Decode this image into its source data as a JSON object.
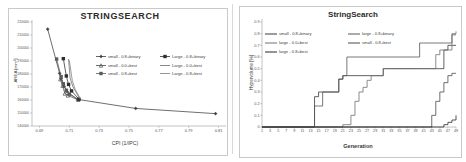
{
  "figure": {
    "background": "#ffffff",
    "panel_count": 2
  },
  "left_panel": {
    "title": "STRINGSEARCH",
    "frame_color": "#c9c9c9"
  },
  "right_panel": {
    "title": "StringSearch",
    "frame_color": "#c9c9c9"
  },
  "chart_data": [
    {
      "id": "left",
      "type": "scatter",
      "title": "STRINGSEARCH",
      "xlabel": "CPI (1/IPC)",
      "ylabel": "AREA [mm²]",
      "xlim": [
        0.685,
        0.815
      ],
      "ylim": [
        140000,
        220000
      ],
      "xticks": [
        0.69,
        0.71,
        0.73,
        0.75,
        0.77,
        0.79,
        0.81
      ],
      "xticklabels": [
        "0.69",
        "0.71",
        "0.73",
        "0.75",
        "0.77",
        "0.79",
        "0.81"
      ],
      "yticks": [
        140000,
        150000,
        160000,
        170000,
        180000,
        190000,
        200000,
        210000,
        220000
      ],
      "yticklabels": [
        "140000",
        "150000",
        "160000",
        "170000",
        "180000",
        "190000",
        "200000",
        "210000",
        "220000"
      ],
      "grid": false,
      "legend_position": "center-right",
      "line_color": "#3f3f3f",
      "series": [
        {
          "name": "small - 0.8+binary",
          "marker": "plus",
          "color": "#3f3f3f",
          "points": [
            {
              "x": 0.6955,
              "y": 214500
            },
            {
              "x": 0.7035,
              "y": 180500
            },
            {
              "x": 0.7045,
              "y": 176500
            },
            {
              "x": 0.7065,
              "y": 170500
            },
            {
              "x": 0.7085,
              "y": 166500
            },
            {
              "x": 0.7155,
              "y": 160500
            },
            {
              "x": 0.7545,
              "y": 153500
            },
            {
              "x": 0.808,
              "y": 149500
            }
          ]
        },
        {
          "name": "small - 0.0+best",
          "marker": "triangle",
          "color": "#4a4a4a",
          "points": [
            {
              "x": 0.704,
              "y": 176000
            },
            {
              "x": 0.7055,
              "y": 171000
            },
            {
              "x": 0.707,
              "y": 165000
            },
            {
              "x": 0.709,
              "y": 163500
            },
            {
              "x": 0.716,
              "y": 160200
            }
          ]
        },
        {
          "name": "small - 0.8+best",
          "marker": "square",
          "color": "#5a5a5a",
          "points": [
            {
              "x": 0.7015,
              "y": 191500
            },
            {
              "x": 0.7045,
              "y": 178000
            },
            {
              "x": 0.706,
              "y": 172500
            },
            {
              "x": 0.708,
              "y": 167500
            },
            {
              "x": 0.71,
              "y": 164500
            },
            {
              "x": 0.716,
              "y": 160400
            }
          ]
        },
        {
          "name": "Large - 0.8+binary",
          "marker": "square",
          "color": "#2f2f2f",
          "points": [
            {
              "x": 0.706,
              "y": 191800
            },
            {
              "x": 0.708,
              "y": 178500
            },
            {
              "x": 0.7095,
              "y": 172000
            },
            {
              "x": 0.7115,
              "y": 167000
            },
            {
              "x": 0.7165,
              "y": 160600
            }
          ]
        },
        {
          "name": "Large - 0.0+best",
          "marker": "none",
          "color": "#6a6a6a",
          "points": [
            {
              "x": 0.7095,
              "y": 191600
            },
            {
              "x": 0.7105,
              "y": 177000
            },
            {
              "x": 0.7125,
              "y": 170000
            },
            {
              "x": 0.717,
              "y": 161000
            }
          ]
        },
        {
          "name": "Large - 0.8+best",
          "marker": "none",
          "color": "#7a7a7a",
          "points": [
            {
              "x": 0.71,
              "y": 190500
            },
            {
              "x": 0.712,
              "y": 175000
            },
            {
              "x": 0.714,
              "y": 168000
            },
            {
              "x": 0.7175,
              "y": 160800
            }
          ]
        }
      ],
      "legend": [
        {
          "label": "small - 0.8+binary",
          "marker": "plus",
          "color": "#3f3f3f"
        },
        {
          "label": "Large - 0.8+binary",
          "marker": "square",
          "color": "#2f2f2f"
        },
        {
          "label": "small - 0.0+best",
          "marker": "triangle",
          "color": "#4a4a4a"
        },
        {
          "label": "Large - 0.0+best",
          "marker": "none",
          "color": "#6a6a6a"
        },
        {
          "label": "small - 0.8+best",
          "marker": "square",
          "color": "#5a5a5a"
        },
        {
          "label": "Large - 0.8+best",
          "marker": "none",
          "color": "#7a7a7a"
        }
      ]
    },
    {
      "id": "right",
      "type": "line",
      "title": "StringSearch",
      "xlabel": "Generation",
      "ylabel": "Hypervolume [%]",
      "xlim": [
        1,
        49
      ],
      "ylim": [
        0,
        0.9
      ],
      "xticks": [
        1,
        3,
        5,
        7,
        9,
        11,
        13,
        15,
        17,
        19,
        21,
        23,
        25,
        27,
        29,
        31,
        33,
        35,
        37,
        39,
        41,
        43,
        45,
        47,
        49
      ],
      "xticklabels": [
        "1",
        "3",
        "5",
        "7",
        "9",
        "11",
        "13",
        "15",
        "17",
        "19",
        "21",
        "23",
        "25",
        "27",
        "29",
        "31",
        "33",
        "35",
        "37",
        "39",
        "41",
        "43",
        "45",
        "47",
        "49"
      ],
      "yticks": [
        0,
        0.1,
        0.2,
        0.3,
        0.4,
        0.5,
        0.6,
        0.7,
        0.8,
        0.9
      ],
      "yticklabels": [
        "0",
        "0.1",
        "0.2",
        "0.3",
        "0.4",
        "0.5",
        "0.6",
        "0.7",
        "0.8",
        "0.9"
      ],
      "grid": false,
      "legend_position": "top-left",
      "series": [
        {
          "name": "small - 0.8+binary",
          "color": "#3a3a3a",
          "x": [
            1,
            13,
            14,
            15,
            19,
            20,
            21,
            22,
            30,
            31,
            32,
            41,
            42,
            45,
            46,
            47,
            48,
            49
          ],
          "y": [
            0,
            0,
            0.26,
            0.3,
            0.3,
            0.41,
            0.44,
            0.44,
            0.44,
            0.5,
            0.5,
            0.5,
            0.5,
            0.5,
            0.66,
            0.7,
            0.7,
            0.7
          ]
        },
        {
          "name": "large - 0.8+binary",
          "color": "#565656",
          "x": [
            1,
            13,
            14,
            15,
            16,
            19,
            20,
            21,
            22,
            23,
            30,
            31,
            39,
            40,
            41,
            45,
            46,
            47,
            48,
            49
          ],
          "y": [
            0,
            0,
            0.18,
            0.18,
            0.3,
            0.3,
            0.41,
            0.44,
            0.6,
            0.6,
            0.6,
            0.6,
            0.6,
            0.72,
            0.72,
            0.72,
            0.72,
            0.72,
            0.79,
            0.79
          ]
        },
        {
          "name": "large - 0.0+best",
          "color": "#707070",
          "x": [
            1,
            20,
            21,
            22,
            23,
            24,
            25,
            26,
            27,
            28,
            29,
            30,
            31,
            32,
            43,
            44,
            45,
            46,
            47,
            48,
            49
          ],
          "y": [
            0,
            0,
            0.02,
            0.02,
            0.1,
            0.22,
            0.3,
            0.34,
            0.4,
            0.44,
            0.44,
            0.44,
            0.5,
            0.5,
            0.5,
            0.62,
            0.66,
            0.66,
            0.66,
            0.8,
            0.82
          ]
        },
        {
          "name": "small - 0.8+best",
          "color": "#4a4a4a",
          "x": [
            1,
            42,
            43,
            44,
            45,
            46,
            47,
            48,
            49
          ],
          "y": [
            0,
            0,
            0.1,
            0.22,
            0.3,
            0.38,
            0.44,
            0.46,
            0.46
          ]
        },
        {
          "name": "large - 0.8+best",
          "color": "#2b2b2b",
          "x": [
            1,
            45,
            46,
            47,
            48,
            49
          ],
          "y": [
            0,
            0,
            0.02,
            0.04,
            0.06,
            0.1
          ]
        }
      ],
      "legend": [
        {
          "label": "small - 0.8+binary",
          "color": "#3a3a3a"
        },
        {
          "label": "large - 0.8+binary",
          "color": "#565656"
        },
        {
          "label": "large - 0.0+best",
          "color": "#707070"
        },
        {
          "label": "small - 0.8+best",
          "color": "#4a4a4a"
        },
        {
          "label": "large - 0.8+best",
          "color": "#2b2b2b"
        }
      ]
    }
  ]
}
